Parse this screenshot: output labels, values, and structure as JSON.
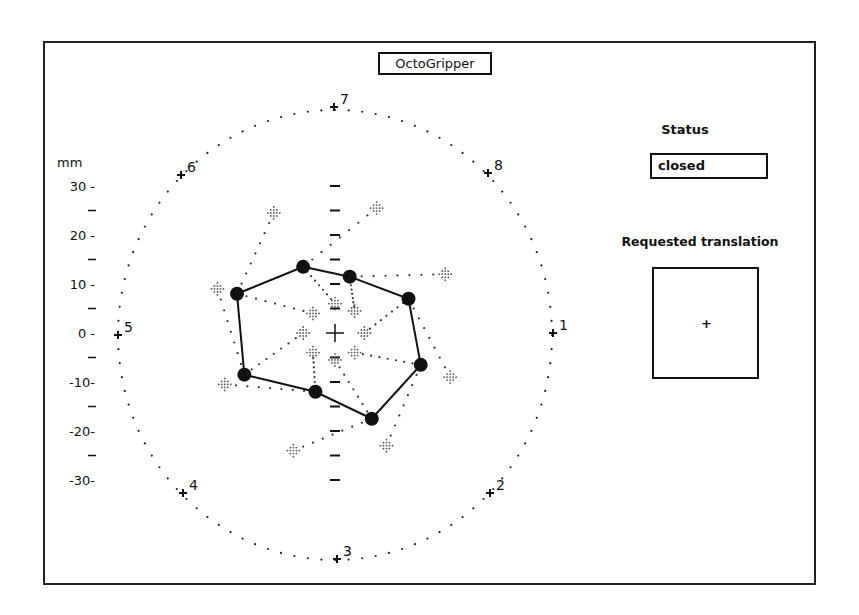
{
  "window": {
    "title": "OctoGripper"
  },
  "status": {
    "label": "Status",
    "value": "closed"
  },
  "translation": {
    "label": "Requested translation",
    "cursor_symbol": "+"
  },
  "axis": {
    "unit_label": "mm",
    "ticks": [
      {
        "value": 30,
        "label": "30 -"
      },
      {
        "value": 20,
        "label": "20 -"
      },
      {
        "value": 10,
        "label": "10 -"
      },
      {
        "value": 0,
        "label": "0 -"
      },
      {
        "value": -10,
        "label": "-10-"
      },
      {
        "value": -20,
        "label": "-20-"
      },
      {
        "value": -30,
        "label": "-30-"
      }
    ]
  },
  "colors": {
    "ink": "#111111",
    "pad_grey": "#555555",
    "background": "#ffffff"
  },
  "chart_data": {
    "type": "scatter",
    "title": "OctoGripper",
    "xlabel": "",
    "ylabel": "mm",
    "ylim": [
      -30,
      30
    ],
    "workspace_circle": {
      "center": [
        0,
        0
      ],
      "radius_mm": 45,
      "style": "dotted"
    },
    "finger_base_markers": [
      {
        "label": "1",
        "x": 44.5,
        "y": 0
      },
      {
        "label": "2",
        "x": 31.5,
        "y": -32
      },
      {
        "label": "3",
        "x": 0,
        "y": -45.5
      },
      {
        "label": "4",
        "x": -31.5,
        "y": -32
      },
      {
        "label": "5",
        "x": -44.5,
        "y": 0
      },
      {
        "label": "6",
        "x": -31.5,
        "y": 32.5
      },
      {
        "label": "7",
        "x": 0,
        "y": 46
      },
      {
        "label": "8",
        "x": 31.5,
        "y": 32.5
      }
    ],
    "gripper_polygon": {
      "name": "finger tips (closed)",
      "points": [
        {
          "x": -20,
          "y": 8
        },
        {
          "x": -6.5,
          "y": 13.5
        },
        {
          "x": 3,
          "y": 11.5
        },
        {
          "x": 15,
          "y": 7
        },
        {
          "x": 17.5,
          "y": -6.5
        },
        {
          "x": 7.5,
          "y": -17.5
        },
        {
          "x": -4,
          "y": -12
        },
        {
          "x": -18.5,
          "y": -8.5
        }
      ]
    },
    "outer_pads": [
      {
        "x": -12.5,
        "y": 24.5
      },
      {
        "x": 8.5,
        "y": 25.5
      },
      {
        "x": 22.5,
        "y": 12
      },
      {
        "x": 23.5,
        "y": -9
      },
      {
        "x": 10.5,
        "y": -23
      },
      {
        "x": -8.5,
        "y": -24
      },
      {
        "x": -22.5,
        "y": -10.5
      },
      {
        "x": -24,
        "y": 9
      }
    ],
    "inner_pads": [
      {
        "x": -4.5,
        "y": 4
      },
      {
        "x": 0,
        "y": 6
      },
      {
        "x": 4,
        "y": 4.5
      },
      {
        "x": 6,
        "y": 0
      },
      {
        "x": 4,
        "y": -4
      },
      {
        "x": 0,
        "y": -5.5
      },
      {
        "x": -4.5,
        "y": -4
      },
      {
        "x": -6.5,
        "y": 0
      }
    ],
    "center_marker": {
      "x": 0,
      "y": 0,
      "symbol": "+"
    }
  }
}
